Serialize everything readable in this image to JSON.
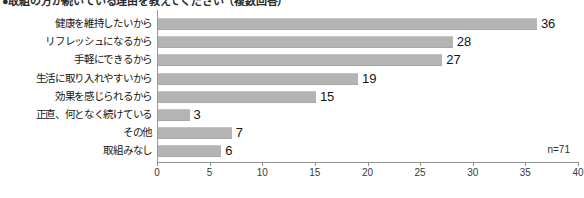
{
  "chart_data": {
    "type": "bar",
    "orientation": "horizontal",
    "title": "●取組の方が続いている理由を教えてください（複数回答）",
    "title_bullet": "●",
    "xlabel": "",
    "ylabel": "",
    "categories": [
      "健康を維持したいから",
      "リフレッシュになるから",
      "手軽にできるから",
      "生活に取り入れやすいから",
      "効果を感じられるから",
      "正直、何となく続けている",
      "その他",
      "取組みなし"
    ],
    "values": [
      36,
      28,
      27,
      19,
      15,
      3,
      7,
      6
    ],
    "xlim": [
      0,
      40
    ],
    "xticks": [
      0,
      5,
      10,
      15,
      20,
      25,
      30,
      35,
      40
    ],
    "xtick_labels": [
      "0",
      "5",
      "10",
      "15",
      "20",
      "25",
      "30",
      "35",
      "40"
    ],
    "grid": false,
    "legend": false,
    "annotation": "n=71",
    "bar_color": "#b4b4b4",
    "axis_color": "#8f8f8f",
    "text_color": "#161616"
  }
}
